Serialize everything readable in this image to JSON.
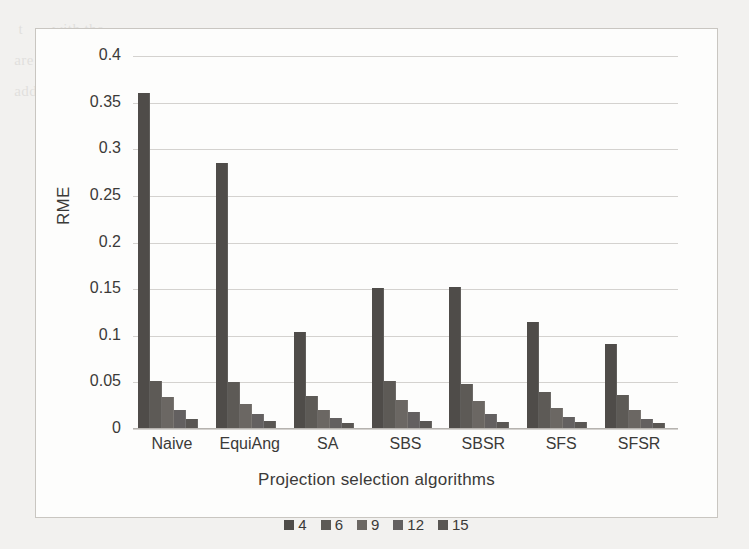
{
  "figure": {
    "background_color": "#f2f1ef",
    "panel_color": "#fdfdfc",
    "border_color": "#c9c6c1"
  },
  "page_bleed_text": "   t       with the                                                        \n  are                                                                       \n  add the                                       the                          \n                                  stable                                     \n                                                                             \n                                                                             \n                                                                             \n                                                                             \n                                                                             \n                                                                             \n                                                                             \n                                                                             \n                                                                             \n                                                                             ",
  "chart_data": {
    "type": "bar",
    "title": "",
    "xlabel": "Projection selection algorithms",
    "ylabel": "RME",
    "categories": [
      "Naive",
      "EquiAng",
      "SA",
      "SBS",
      "SBSR",
      "SFS",
      "SFSR"
    ],
    "ylim": [
      0,
      0.4
    ],
    "yticks": [
      0,
      0.05,
      0.1,
      0.15,
      0.2,
      0.25,
      0.3,
      0.35,
      0.4
    ],
    "ytick_labels": [
      "0",
      "0.05",
      "0.1",
      "0.15",
      "0.2",
      "0.25",
      "0.3",
      "0.35",
      "0.4"
    ],
    "grid": true,
    "legend_position": "bottom",
    "series": [
      {
        "name": "4",
        "color": "#4f4c49",
        "values": [
          0.36,
          0.285,
          0.104,
          0.151,
          0.152,
          0.115,
          0.091
        ]
      },
      {
        "name": "6",
        "color": "#5d5a56",
        "values": [
          0.052,
          0.05,
          0.035,
          0.052,
          0.048,
          0.04,
          0.036
        ]
      },
      {
        "name": "9",
        "color": "#6b6763",
        "values": [
          0.034,
          0.027,
          0.02,
          0.031,
          0.03,
          0.023,
          0.02
        ]
      },
      {
        "name": "12",
        "color": "#636060",
        "values": [
          0.02,
          0.016,
          0.012,
          0.018,
          0.016,
          0.013,
          0.011
        ]
      },
      {
        "name": "15",
        "color": "#595653",
        "values": [
          0.011,
          0.009,
          0.006,
          0.009,
          0.008,
          0.007,
          0.006
        ]
      }
    ]
  },
  "legend": {
    "entries": [
      "4",
      "6",
      "9",
      "12",
      "15"
    ]
  }
}
